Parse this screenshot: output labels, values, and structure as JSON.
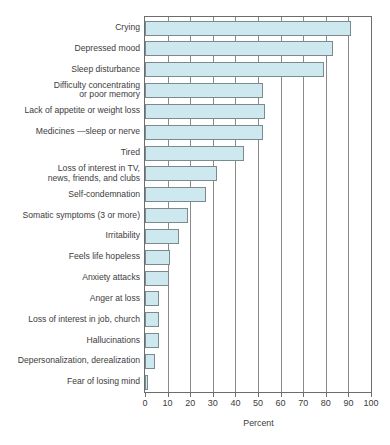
{
  "chart_data": {
    "type": "bar",
    "orientation": "horizontal",
    "title": "",
    "xlabel": "Percent",
    "ylabel": "",
    "xlim": [
      0,
      100
    ],
    "xticks": [
      0,
      10,
      20,
      30,
      40,
      50,
      60,
      70,
      80,
      90,
      100
    ],
    "grid": true,
    "grid_axis": "x",
    "legend": null,
    "bar_fill_color": "#cee8f0",
    "bar_border_color": "#7b8a8e",
    "categories": [
      "Crying",
      "Depressed mood",
      "Sleep disturbance",
      "Difficulty concentrating\nor poor memory",
      "Lack of appetite or weight loss",
      "Medicines —sleep or nerve",
      "Tired",
      "Loss of interest in TV,\nnews, friends, and clubs",
      "Self-condemnation",
      "Somatic symptoms (3 or more)",
      "Irritability",
      "Feels life hopeless",
      "Anxiety attacks",
      "Anger at loss",
      "Loss of interest in job, church",
      "Hallucinations",
      "Depersonalization, derealization",
      "Fear of losing mind"
    ],
    "values": [
      91,
      83,
      79,
      52,
      53,
      52,
      44,
      32,
      27,
      19,
      15,
      11,
      10.5,
      6,
      6,
      6,
      4.5,
      1
    ]
  },
  "axis": {
    "tick_labels": [
      "0",
      "10",
      "20",
      "30",
      "40",
      "50",
      "60",
      "70",
      "80",
      "90",
      "100"
    ],
    "percent_label": "Percent"
  }
}
